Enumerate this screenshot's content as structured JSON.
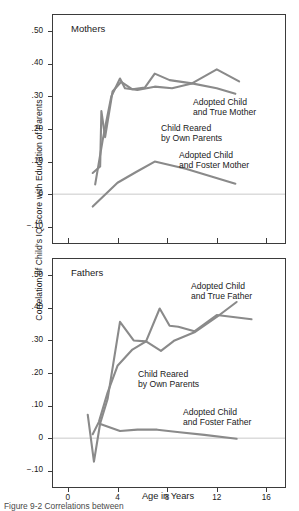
{
  "figure": {
    "y_axis_title": "Correlation of Child's IQ Score with Education of Parents",
    "x_axis_title": "Age in Years",
    "caption": "Figure 9-2 Correlations between"
  },
  "style": {
    "line_color": "#8a8a8a",
    "axis_color": "#3b3b3b",
    "zero_line_color": "#c9c9c9",
    "text_color": "#1a1a1a"
  },
  "axes": {
    "y_ticks": [
      ".50",
      ".40",
      ".30",
      ".20",
      ".10",
      "0",
      "−.10"
    ],
    "y_values": [
      0.5,
      0.4,
      0.3,
      0.2,
      0.1,
      0,
      -0.1
    ],
    "y_min": -0.15,
    "y_max": 0.55,
    "x_ticks": [
      "0",
      "4",
      "8",
      "12",
      "16"
    ],
    "x_values": [
      0,
      4,
      8,
      12,
      16
    ],
    "x_min": -1.2,
    "x_max": 17.5
  },
  "panels": [
    {
      "id": "mothers",
      "title": "Mothers",
      "show_x_labels": false,
      "annotations": [
        {
          "name": "annotation-own-parents",
          "text": "Child Reared\nby Own Parents",
          "x": 108,
          "y": 108
        },
        {
          "name": "annotation-true-mother",
          "text": "Adopted Child\nand True Mother",
          "x": 140,
          "y": 82
        },
        {
          "name": "annotation-foster-mother",
          "text": "Adopted Child\nand Foster Mother",
          "x": 126,
          "y": 135
        }
      ]
    },
    {
      "id": "fathers",
      "title": "Fathers",
      "show_x_labels": true,
      "annotations": [
        {
          "name": "annotation-own-parents",
          "text": "Child Reared\nby Own Parents",
          "x": 85,
          "y": 110
        },
        {
          "name": "annotation-true-father",
          "text": "Adopted Child\nand True Father",
          "x": 138,
          "y": 22
        },
        {
          "name": "annotation-foster-father",
          "text": "Adopted Child\nand Foster Father",
          "x": 130,
          "y": 148
        }
      ]
    }
  ],
  "chart_data": {
    "type": "line",
    "xlabel": "Age in Years",
    "ylabel": "Correlation of Child's IQ Score with Education of Parents",
    "xlim": [
      -1.2,
      17.5
    ],
    "ylim": [
      -0.15,
      0.55
    ],
    "grid": false,
    "legend": "inline-annotations",
    "zero_reference_line": 0,
    "panels": [
      {
        "panel": "Mothers",
        "series": [
          {
            "name": "Child Reared by Own Parents",
            "points": [
              [
                2.0,
                0.065
              ],
              [
                2.6,
                0.085
              ],
              [
                2.7,
                0.255
              ],
              [
                3.0,
                0.175
              ],
              [
                3.6,
                0.315
              ],
              [
                4.3,
                0.345
              ],
              [
                5.2,
                0.322
              ],
              [
                6.2,
                0.327
              ],
              [
                7.0,
                0.37
              ],
              [
                8.2,
                0.35
              ],
              [
                10.0,
                0.34
              ],
              [
                12.0,
                0.383
              ],
              [
                13.8,
                0.346
              ]
            ]
          },
          {
            "name": "Adopted Child and True Mother",
            "points": [
              [
                2.2,
                0.03
              ],
              [
                2.8,
                0.165
              ],
              [
                3.0,
                0.205
              ],
              [
                3.5,
                0.3
              ],
              [
                4.2,
                0.355
              ],
              [
                4.6,
                0.325
              ],
              [
                5.6,
                0.32
              ],
              [
                7.0,
                0.33
              ],
              [
                8.4,
                0.325
              ],
              [
                10.0,
                0.34
              ],
              [
                12.0,
                0.325
              ],
              [
                13.5,
                0.308
              ]
            ]
          },
          {
            "name": "Adopted Child and Foster Mother",
            "points": [
              [
                2.0,
                -0.038
              ],
              [
                4.0,
                0.035
              ],
              [
                5.5,
                0.068
              ],
              [
                7.0,
                0.1
              ],
              [
                9.5,
                0.078
              ],
              [
                11.5,
                0.055
              ],
              [
                13.5,
                0.032
              ]
            ]
          }
        ]
      },
      {
        "panel": "Fathers",
        "series": [
          {
            "name": "Child Reared by Own Parents",
            "points": [
              [
                1.6,
                0.072
              ],
              [
                2.1,
                -0.072
              ],
              [
                2.6,
                0.045
              ],
              [
                3.2,
                0.12
              ],
              [
                4.2,
                0.357
              ],
              [
                5.3,
                0.3
              ],
              [
                6.3,
                0.297
              ],
              [
                7.4,
                0.398
              ],
              [
                8.2,
                0.345
              ],
              [
                8.9,
                0.342
              ],
              [
                10.2,
                0.328
              ],
              [
                12.0,
                0.378
              ],
              [
                14.8,
                0.365
              ]
            ]
          },
          {
            "name": "Adopted Child and True Father",
            "points": [
              [
                2.0,
                0.012
              ],
              [
                2.5,
                0.05
              ],
              [
                3.2,
                0.14
              ],
              [
                4.0,
                0.222
              ],
              [
                5.2,
                0.272
              ],
              [
                6.3,
                0.297
              ],
              [
                7.5,
                0.268
              ],
              [
                8.6,
                0.3
              ],
              [
                10.2,
                0.325
              ],
              [
                12.0,
                0.372
              ],
              [
                13.6,
                0.418
              ]
            ]
          },
          {
            "name": "Adopted Child and Foster Father",
            "points": [
              [
                2.5,
                0.045
              ],
              [
                4.2,
                0.022
              ],
              [
                5.6,
                0.026
              ],
              [
                7.2,
                0.026
              ],
              [
                9.0,
                0.018
              ],
              [
                11.0,
                0.01
              ],
              [
                13.6,
                -0.002
              ]
            ]
          }
        ]
      }
    ]
  }
}
